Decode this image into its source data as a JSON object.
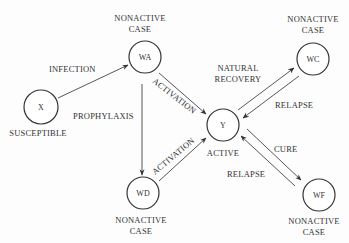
{
  "diagram": {
    "type": "state-transition",
    "nodes": [
      {
        "id": "X",
        "label": "X",
        "caption": [
          "SUSCEPTIBLE"
        ],
        "cx": 41,
        "cy": 107,
        "r": 17
      },
      {
        "id": "WA",
        "label": "WA",
        "caption": [
          "NONACTIVE",
          "CASE"
        ],
        "cx": 145,
        "cy": 57,
        "r": 16
      },
      {
        "id": "WC",
        "label": "WC",
        "caption": [
          "NONACTIVE",
          "CASE"
        ],
        "cx": 313,
        "cy": 59,
        "r": 16
      },
      {
        "id": "Y",
        "label": "Y",
        "caption": [
          "ACTIVE"
        ],
        "cx": 223,
        "cy": 125,
        "r": 16
      },
      {
        "id": "WD",
        "label": "WD",
        "caption": [
          "NONACTIVE",
          "CASE"
        ],
        "cx": 143,
        "cy": 193,
        "r": 16
      },
      {
        "id": "WF",
        "label": "WF",
        "caption": [
          "NONACTIVE",
          "CASE"
        ],
        "cx": 319,
        "cy": 195,
        "r": 16
      }
    ],
    "edges": [
      {
        "from": "X",
        "to": "WA",
        "label": "INFECTION"
      },
      {
        "from": "WA",
        "to": "WD",
        "label": "PROPHYLAXIS"
      },
      {
        "from": "WA",
        "to": "Y",
        "label": "ACTIVATION"
      },
      {
        "from": "WD",
        "to": "Y",
        "label": "ACTIVATION"
      },
      {
        "from": "Y",
        "to": "WC",
        "label": "NATURAL RECOVERY"
      },
      {
        "from": "WC",
        "to": "Y",
        "label": "RELAPSE"
      },
      {
        "from": "Y",
        "to": "WF",
        "label": "CURE"
      },
      {
        "from": "WF",
        "to": "Y",
        "label": "RELAPSE"
      }
    ]
  },
  "labels": {
    "infection": "INFECTION",
    "prophylaxis": "PROPHYLAXIS",
    "activation_top": "ACTIVATION",
    "activation_bottom": "ACTIVATION",
    "natural_recovery_1": "NATURAL",
    "natural_recovery_2": "RECOVERY",
    "relapse_wc": "RELAPSE",
    "cure": "CURE",
    "relapse_wf": "RELAPSE",
    "node_x": "X",
    "node_wa": "WA",
    "node_wc": "WC",
    "node_y": "Y",
    "node_wd": "WD",
    "node_wf": "WF",
    "caption_x": "SUSCEPTIBLE",
    "caption_wa_1": "NONACTIVE",
    "caption_wa_2": "CASE",
    "caption_wc_1": "NONACTIVE",
    "caption_wc_2": "CASE",
    "caption_y": "ACTIVE",
    "caption_wd_1": "NONACTIVE",
    "caption_wd_2": "CASE",
    "caption_wf_1": "NONACTIVE",
    "caption_wf_2": "CASE"
  }
}
